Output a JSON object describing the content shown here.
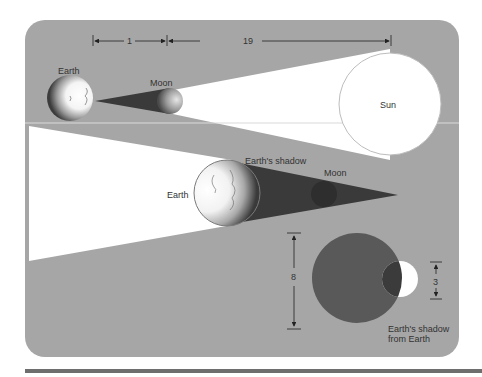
{
  "colors": {
    "background": "#ffffff",
    "panel": "#a6a6a6",
    "light": "#ffffff",
    "umbra": "#3a3a3a",
    "shadow_disc": "#595959",
    "moon_in_shadow": "#3d3d3d",
    "bottom_bar": "#6e6e6e",
    "line": "#222222"
  },
  "top_diagram": {
    "distance_earth_moon": "1",
    "distance_moon_sun": "19",
    "earth_label": "Earth",
    "moon_label": "Moon",
    "sun_label": "Sun"
  },
  "middle_diagram": {
    "earth_label": "Earth",
    "shadow_label": "Earth's shadow",
    "moon_label": "Moon"
  },
  "bottom_diagram": {
    "shadow_size": "8",
    "moon_size": "3",
    "caption_line1": "Earth's shadow",
    "caption_line2": "from Earth"
  }
}
